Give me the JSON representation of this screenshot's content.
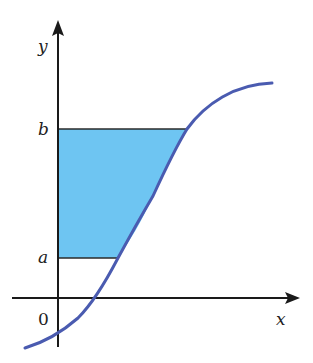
{
  "diagram": {
    "labels": {
      "y_axis": "y",
      "x_axis": "x",
      "origin": "0",
      "upper_bound": "b",
      "lower_bound": "a"
    },
    "colors": {
      "fill": "#6ec5f2",
      "curve": "#4a5bb0",
      "axis": "#1a1a1a",
      "bound_line": "#2a2a2a"
    },
    "curve_shape": "s-shaped increasing curve",
    "shaded_region": "area between y-axis and curve from y=a to y=b"
  }
}
